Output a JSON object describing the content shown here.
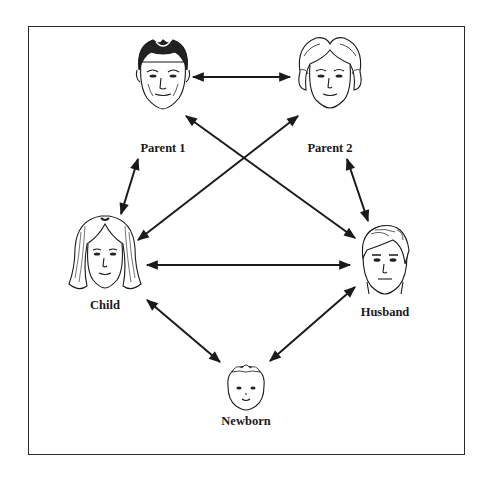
{
  "diagram": {
    "type": "family-relationship-network",
    "nodes": [
      {
        "id": "parent1",
        "label": "Parent 1",
        "x": 163,
        "y": 75,
        "label_y": 141,
        "face": "older-man"
      },
      {
        "id": "parent2",
        "label": "Parent 2",
        "x": 330,
        "y": 75,
        "label_y": 141,
        "face": "older-woman"
      },
      {
        "id": "child",
        "label": "Child",
        "x": 105,
        "y": 262,
        "label_y": 299,
        "face": "young-woman"
      },
      {
        "id": "husband",
        "label": "Husband",
        "x": 385,
        "y": 262,
        "label_y": 305,
        "face": "young-man"
      },
      {
        "id": "newborn",
        "label": "Newborn",
        "x": 245,
        "y": 395,
        "label_y": 414,
        "face": "baby"
      }
    ],
    "edges": [
      {
        "from": "parent1",
        "to": "parent2",
        "bidirectional": true
      },
      {
        "from": "parent1",
        "to": "child",
        "bidirectional": true
      },
      {
        "from": "parent1",
        "to": "husband",
        "bidirectional": true
      },
      {
        "from": "parent2",
        "to": "child",
        "bidirectional": true
      },
      {
        "from": "parent2",
        "to": "husband",
        "bidirectional": true
      },
      {
        "from": "child",
        "to": "husband",
        "bidirectional": true
      },
      {
        "from": "child",
        "to": "newborn",
        "bidirectional": true
      },
      {
        "from": "husband",
        "to": "newborn",
        "bidirectional": true
      }
    ],
    "colors": {
      "line": "#1a1a1a",
      "border": "#2a2a2a",
      "background": "#ffffff"
    }
  },
  "labels": {
    "parent1": "Parent 1",
    "parent2": "Parent 2",
    "child": "Child",
    "husband": "Husband",
    "newborn": "Newborn"
  }
}
